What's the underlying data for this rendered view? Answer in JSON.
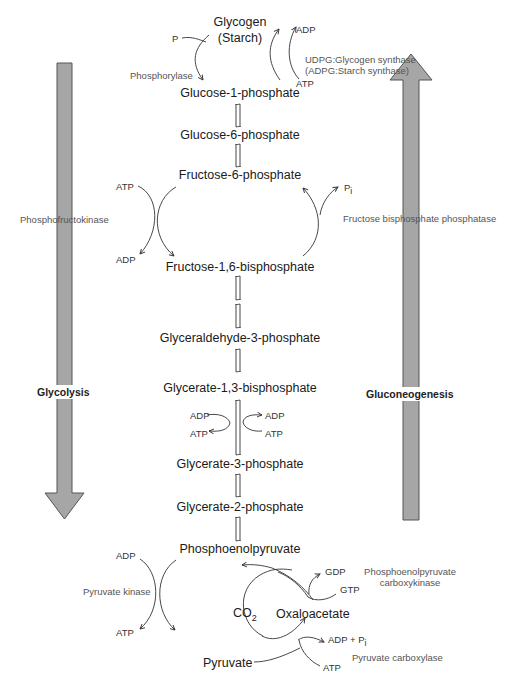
{
  "metabolites": {
    "glycogen": "Glycogen",
    "starch": "(Starch)",
    "g1p": "Glucose-1-phosphate",
    "g6p": "Glucose-6-phosphate",
    "f6p": "Fructose-6-phosphate",
    "f16bp": "Fructose-1,6-bisphosphate",
    "gap": "Glyceraldehyde-3-phosphate",
    "bpg13": "Glycerate-1,3-bisphosphate",
    "pg3": "Glycerate-3-phosphate",
    "pg2": "Glycerate-2-phosphate",
    "pep": "Phosphoenolpyruvate",
    "co2_main": "CO",
    "co2_sub": "2",
    "oxaloacetate": "Oxaloacetate",
    "pyruvate": "Pyruvate"
  },
  "cofactors": {
    "p_top": "P",
    "adp_top": "ADP",
    "atp_top": "ATP",
    "atp_pfk": "ATP",
    "adp_pfk": "ADP",
    "pi_fbp": "P",
    "pi_fbp_sub": "i",
    "adp_pgk_left": "ADP",
    "atp_pgk_left": "ATP",
    "adp_pgk_right": "ADP",
    "atp_pgk_right": "ATP",
    "adp_pk": "ADP",
    "atp_pk": "ATP",
    "gdp": "GDP",
    "gtp": "GTP",
    "adp_pi_pc": "ADP + P",
    "adp_pi_pc_sub": "i",
    "atp_pc": "ATP"
  },
  "enzymes": {
    "phosphorylase": "Phosphorylase",
    "glycogen_synthase": "UDPG:Glycogen synthase",
    "starch_synthase": "(ADPG:Starch synthase)",
    "pfk": "Phosphofructokinase",
    "fbpase": "Fructose bisphosphate phosphatase",
    "pyruvate_kinase": "Pyruvate kinase",
    "pepck_line1": "Phosphoenolpyruvate",
    "pepck_line2": "carboxykinase",
    "pyruvate_carboxylase": "Pyruvate carboxylase"
  },
  "pathways": {
    "glycolysis": "Glycolysis",
    "gluconeogenesis": "Gluconeogenesis"
  },
  "colors": {
    "big_arrow_fill": "#a6a6a6",
    "big_arrow_stroke": "#555555",
    "line": "#333333"
  }
}
